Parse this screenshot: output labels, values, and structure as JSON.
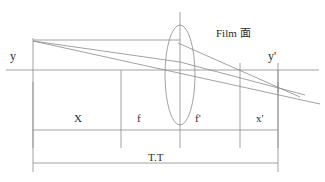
{
  "diagram": {
    "labels": {
      "object_height": "y",
      "image_height": "y'",
      "film_plane": "Film 面",
      "segment_object_distance": "X",
      "segment_focal_front": "f",
      "segment_focal_back": "f'",
      "segment_image_distance": "x'",
      "total_track": "T.T"
    },
    "colors": {
      "line": "#8a8a8a",
      "text": "#2b2b2b",
      "background": "#ffffff"
    },
    "geometry": {
      "axis_y": 70,
      "object_plane_x": 33,
      "front_focal_x": 121,
      "lens_x": 180,
      "back_focal_x": 240,
      "film_plane_x": 278,
      "lens_top_y": 25,
      "lens_bottom_y": 125,
      "lens_half_width": 15,
      "object_top_y": 41,
      "image_bottom_y": 88,
      "dimension_row_y": 130,
      "total_track_row_y": 163
    },
    "rays": [
      {
        "name": "chief-ray",
        "from_x": 33,
        "from_y": 41,
        "to_x": 320,
        "to_y": 103
      },
      {
        "name": "parallel-then-focal-ray",
        "from_x": 33,
        "from_y": 41,
        "via_x": 180,
        "via_y": 70,
        "to_x": 305,
        "to_y": 95
      },
      {
        "name": "through-lens-ray",
        "from_x": 180,
        "from_y": 41,
        "to_x": 300,
        "to_y": 97
      }
    ]
  }
}
